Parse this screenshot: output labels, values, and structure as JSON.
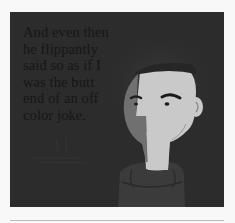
{
  "panel": {
    "caption_lines": [
      "And even then",
      "he flippantly",
      "said so as if I",
      "was the butt",
      "end of an off",
      "color joke."
    ]
  },
  "illustration": {
    "subject": "man with half-shadowed face wearing a turtleneck",
    "colors": {
      "background": "#2c2c2c",
      "face_light": "#c9c9c9",
      "face_shadow": "#707070",
      "hair": "#262626",
      "sweater": "#3b3b3b",
      "features": "#1a1a1a"
    }
  }
}
